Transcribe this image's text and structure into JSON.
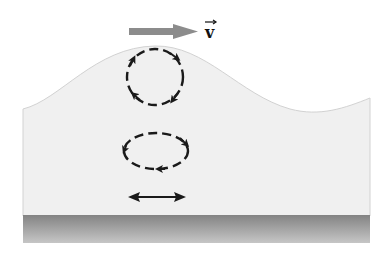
{
  "diagram": {
    "velocity_label": "v",
    "velocity_label_has_vector_arrow": true,
    "elements": [
      {
        "name": "velocity-arrow",
        "direction": "right",
        "color": "#8c8c8c"
      },
      {
        "name": "surface-orbit",
        "shape": "circle",
        "style": "dashed",
        "rotation": "clockwise"
      },
      {
        "name": "mid-orbit",
        "shape": "ellipse",
        "style": "dashed",
        "rotation": "clockwise"
      },
      {
        "name": "bottom-motion",
        "shape": "double-headed-arrow",
        "direction": "horizontal"
      },
      {
        "name": "sea-floor",
        "color_top": "#858585",
        "color_bottom": "#c4c4c4"
      }
    ],
    "colors": {
      "water": "#f0f0f0",
      "water_edge": "#cfcfcf",
      "orbit": "#1a1a1a",
      "velocity_arrow": "#8c8c8c"
    }
  }
}
